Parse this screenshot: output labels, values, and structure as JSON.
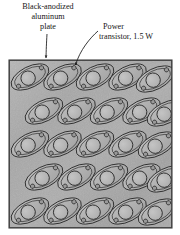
{
  "figure": {
    "background_color": "#ffffff",
    "text_color": "#161616"
  },
  "labels": {
    "plate": {
      "name": "plate-label",
      "lines": [
        "Black-anodized",
        "aluminum",
        "plate"
      ]
    },
    "transistor": {
      "name": "transistor-label",
      "lines": [
        "Power",
        "transistor, 1.5 W"
      ],
      "power_rating": "1.5 W"
    }
  },
  "leaders": [
    {
      "name": "plate-leader-line",
      "from_label": "plate",
      "style": "straight-vertical",
      "arrow": true
    },
    {
      "name": "transistor-leader-line",
      "from_label": "transistor",
      "style": "curved",
      "arrow": true
    }
  ],
  "plate": {
    "name": "aluminum-plate",
    "material": "Black-anodized aluminum",
    "fill_color": "#a9a9a9",
    "edge_color": "#4a4a4a",
    "rect": {
      "x": 9,
      "y": 60,
      "width": 163,
      "height": 168
    }
  },
  "transistor_array": {
    "name": "power-transistor-array",
    "count": 25,
    "rows": 5,
    "columns": 5,
    "staggered": true,
    "row_offset_px": 15,
    "column_spacing_px": 32.5,
    "row_spacing_px": 32.5,
    "tilt_degrees": -27,
    "body_color": "#b2b2b2",
    "outline_color": "#2e2e2e",
    "package": "TO-3",
    "body": {
      "rx": 20.5,
      "ry": 10.5
    },
    "flange": {
      "rx": 16.5,
      "ry": 8.2
    },
    "center_circle_r": 7.2,
    "mounting_holes": 2,
    "mounting_hole_r": 2.1,
    "origin": {
      "x": 26,
      "y": 77
    }
  }
}
